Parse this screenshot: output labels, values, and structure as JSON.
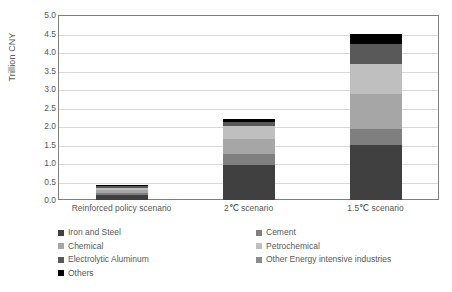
{
  "chart_data": {
    "type": "bar",
    "stacked": true,
    "title": "",
    "xlabel": "",
    "ylabel": "Trillion CNY",
    "ylim": [
      0.0,
      5.0
    ],
    "ytick_step": 0.5,
    "ytick_labels": [
      "0.0",
      "0.5",
      "1.0",
      "1.5",
      "2.0",
      "2.5",
      "3.0",
      "3.5",
      "4.0",
      "4.5",
      "5.0"
    ],
    "ytick_values": [
      0.0,
      0.5,
      1.0,
      1.5,
      2.0,
      2.5,
      3.0,
      3.5,
      4.0,
      4.5,
      5.0
    ],
    "grid": true,
    "grid_axis": "y",
    "legend_position": "bottom",
    "categories": [
      "Reinforced policy scenario",
      "2℃ scenario",
      "1.5℃ scenario"
    ],
    "series": [
      {
        "name": "Iron and Steel",
        "color": "#404040",
        "values": [
          0.13,
          0.95,
          1.5
        ]
      },
      {
        "name": "Cement",
        "color": "#7f7f7f",
        "values": [
          0.06,
          0.3,
          0.42
        ]
      },
      {
        "name": "Chemical",
        "color": "#a6a6a6",
        "values": [
          0.08,
          0.4,
          0.95
        ]
      },
      {
        "name": "Petrochemical",
        "color": "#bfbfbf",
        "values": [
          0.06,
          0.35,
          0.8
        ]
      },
      {
        "name": "Electrolytic Aluminum",
        "color": "#595959",
        "values": [
          0.04,
          0.12,
          0.55
        ]
      },
      {
        "name": "Other Energy intensive industries",
        "color": "#8c8c8c",
        "values": [
          0.0,
          0.0,
          0.0
        ]
      },
      {
        "name": "Others",
        "color": "#000000",
        "values": [
          0.03,
          0.08,
          0.28
        ]
      }
    ],
    "totals": [
      0.4,
      2.2,
      4.5
    ]
  },
  "axis": {
    "y_title": "Trillion CNY"
  },
  "legend": {
    "left_column": [
      {
        "label": "Iron and Steel",
        "color": "#404040"
      },
      {
        "label": "Chemical",
        "color": "#a6a6a6"
      },
      {
        "label": "Electrolytic Aluminum",
        "color": "#595959"
      },
      {
        "label": "Others",
        "color": "#000000"
      }
    ],
    "right_column": [
      {
        "label": "Cement",
        "color": "#7f7f7f"
      },
      {
        "label": "Petrochemical",
        "color": "#bfbfbf"
      },
      {
        "label": "Other Energy intensive industries",
        "color": "#8c8c8c"
      }
    ]
  },
  "colors": {
    "frame": "#7f7f7f",
    "gridline": "#d9d9d9",
    "text": "#595959",
    "background": "#ffffff"
  }
}
